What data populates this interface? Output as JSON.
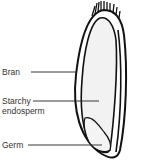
{
  "diagram": {
    "labels": [
      {
        "id": "bran",
        "text": "Bran"
      },
      {
        "id": "starchy",
        "text": "Starchy",
        "text2": "endosperm"
      },
      {
        "id": "germ",
        "text": "Germ"
      }
    ],
    "colors": {
      "outline": "#111111",
      "fill": "#f2f2f2",
      "text": "#333333"
    }
  }
}
